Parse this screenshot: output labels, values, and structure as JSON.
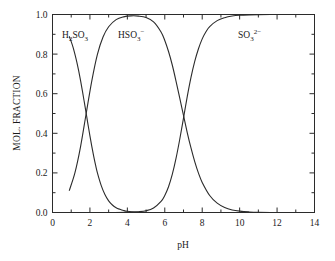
{
  "chart_data": {
    "type": "line",
    "title": "",
    "xlabel": "pH",
    "ylabel": "MOL. FRACTION",
    "xlim": [
      0,
      14
    ],
    "ylim": [
      0.0,
      1.0
    ],
    "grid": false,
    "legend_position": "inline-annotations",
    "x_major_ticks": [
      0,
      2,
      4,
      6,
      8,
      10,
      12,
      14
    ],
    "x_major_tick_labels": [
      "0",
      "2",
      "4",
      "6",
      "8",
      "10",
      "12",
      "14"
    ],
    "x_minor_ticks": [
      1,
      3,
      5,
      7,
      9,
      11,
      13
    ],
    "y_major_ticks": [
      0.0,
      0.2,
      0.4,
      0.6,
      0.8,
      1.0
    ],
    "y_major_tick_labels": [
      "0.0",
      "0.2",
      "0.4",
      "0.6",
      "0.8",
      "1.0"
    ],
    "y_minor_ticks": [
      0.1,
      0.3,
      0.5,
      0.7,
      0.9
    ],
    "pKa1": 1.8,
    "pKa2": 7.0,
    "annotations": [
      {
        "name": "h2so3-label",
        "text_base": "H",
        "sub1": "2",
        "mid": "SO",
        "sub2": "3",
        "sup": "",
        "x_px": 62,
        "y_px": 38
      },
      {
        "name": "hso3-label",
        "text_base": "HSO",
        "sub1": "3",
        "mid": "",
        "sub2": "",
        "sup": "−",
        "x_px": 118,
        "y_px": 38
      },
      {
        "name": "so3-label",
        "text_base": "SO",
        "sub1": "3",
        "mid": "",
        "sub2": "",
        "sup": "2−",
        "x_px": 238,
        "y_px": 38
      }
    ],
    "series": [
      {
        "name": "H2SO3",
        "label": "H₂SO₃",
        "x": [
          0.9,
          1.0,
          1.1,
          1.2,
          1.3,
          1.4,
          1.5,
          1.6,
          1.7,
          1.8,
          1.9,
          2.0,
          2.1,
          2.2,
          2.3,
          2.4,
          2.6,
          2.8,
          3.0,
          3.2,
          3.4,
          3.6,
          3.8,
          4.0,
          4.4,
          4.8,
          5.2,
          5.6,
          6.0,
          6.5,
          7.0,
          7.5,
          8.0,
          9.0,
          10.0
        ],
        "y": [
          0.888,
          0.863,
          0.834,
          0.799,
          0.76,
          0.715,
          0.666,
          0.613,
          0.557,
          0.5,
          0.443,
          0.387,
          0.334,
          0.285,
          0.24,
          0.2,
          0.137,
          0.091,
          0.059,
          0.038,
          0.024,
          0.016,
          0.01,
          0.006,
          0.002,
          0.001,
          0.0,
          0.0,
          0.0,
          0.0,
          0.0,
          0.0,
          0.0,
          0.0,
          0.0
        ]
      },
      {
        "name": "HSO3-",
        "label": "HSO₃⁻",
        "x": [
          0.9,
          1.2,
          1.5,
          1.8,
          2.1,
          2.4,
          2.7,
          3.0,
          3.4,
          3.8,
          4.2,
          4.6,
          5.0,
          5.4,
          5.8,
          6.0,
          6.2,
          6.4,
          6.6,
          6.8,
          7.0,
          7.2,
          7.4,
          7.6,
          7.8,
          8.0,
          8.4,
          8.8,
          9.2,
          9.6,
          10.0,
          10.5,
          11.0,
          12.0,
          13.0,
          14.0
        ],
        "y": [
          0.112,
          0.201,
          0.333,
          0.5,
          0.665,
          0.799,
          0.886,
          0.938,
          0.974,
          0.988,
          0.993,
          0.992,
          0.985,
          0.963,
          0.912,
          0.869,
          0.813,
          0.745,
          0.664,
          0.578,
          0.49,
          0.404,
          0.326,
          0.257,
          0.199,
          0.152,
          0.086,
          0.047,
          0.025,
          0.013,
          0.007,
          0.003,
          0.001,
          0.0,
          0.0,
          0.0
        ]
      },
      {
        "name": "SO3 2-",
        "label": "SO₃²⁻",
        "x": [
          2.0,
          3.0,
          4.0,
          4.6,
          5.0,
          5.4,
          5.8,
          6.0,
          6.2,
          6.4,
          6.6,
          6.8,
          7.0,
          7.2,
          7.4,
          7.6,
          7.8,
          8.0,
          8.2,
          8.4,
          8.8,
          9.2,
          9.6,
          10.0,
          10.5,
          11.0,
          12.0,
          13.0,
          14.0
        ],
        "y": [
          0.0,
          0.0,
          0.001,
          0.004,
          0.009,
          0.023,
          0.056,
          0.086,
          0.13,
          0.192,
          0.273,
          0.37,
          0.477,
          0.585,
          0.682,
          0.763,
          0.827,
          0.877,
          0.913,
          0.939,
          0.969,
          0.984,
          0.992,
          0.996,
          0.998,
          0.999,
          1.0,
          1.0,
          1.0
        ]
      }
    ]
  },
  "axes": {
    "x_title": "pH",
    "y_title": "MOL. FRACTION"
  }
}
